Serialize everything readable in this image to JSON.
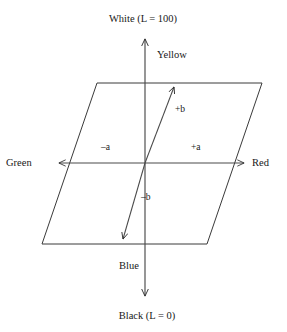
{
  "diagram": {
    "background_color": "#ffffff",
    "line_color": "#2b2b2b",
    "text_color": "#181818",
    "labels": {
      "white": "White (L = 100)",
      "black": "Black (L = 0)",
      "yellow": "Yellow",
      "blue": "Blue",
      "green": "Green",
      "red": "Red",
      "plus_a": "+a",
      "minus_a": "–a",
      "plus_b": "+b",
      "minus_b": "–b"
    },
    "geometry": {
      "center": [
        145,
        163
      ],
      "parallelogram": [
        [
          97,
          83
        ],
        [
          262,
          83
        ],
        [
          207,
          244
        ],
        [
          42,
          244
        ]
      ],
      "l_axis": {
        "x": 145,
        "top_y": 38,
        "bottom_y": 297
      },
      "a_axis": {
        "y": 163,
        "left_x": 58,
        "right_x": 245
      },
      "b_axis": {
        "from": [
          122,
          240
        ],
        "to": [
          175,
          86
        ]
      }
    }
  }
}
